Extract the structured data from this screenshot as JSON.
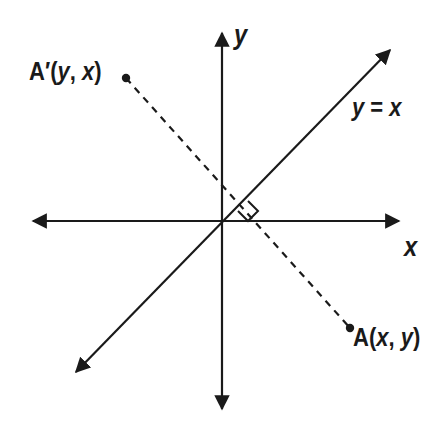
{
  "figure": {
    "background_color": "#ffffff",
    "stroke_color": "#1a1a1a",
    "width": 442,
    "height": 433
  },
  "axes": {
    "origin": {
      "x": 222,
      "y": 221
    },
    "x_axis": {
      "label": "x",
      "from": {
        "x": 30,
        "y": 221
      },
      "to": {
        "x": 402,
        "y": 221
      },
      "arrows": "both"
    },
    "y_axis": {
      "label": "y",
      "from": {
        "x": 222,
        "y": 412
      },
      "to": {
        "x": 222,
        "y": 30
      },
      "arrows": "both"
    }
  },
  "lines": [
    {
      "name": "line-y-equals-x",
      "label": "y = x",
      "label_parts": {
        "lhs": "y",
        "operator": " = ",
        "rhs": "x"
      },
      "style": "solid",
      "arrows": "both",
      "slope": 1,
      "from": {
        "x": 73,
        "y": 375
      },
      "to": {
        "x": 393,
        "y": 47
      }
    },
    {
      "name": "segment-a-to-a-prime",
      "style": "dashed",
      "arrows": "none",
      "slope": -1,
      "from": {
        "x": 126,
        "y": 78
      },
      "to": {
        "x": 350,
        "y": 328
      }
    }
  ],
  "points": [
    {
      "name": "point-a-prime",
      "label": "A'(y, x)",
      "label_parts": {
        "prefix": "A′(",
        "first": "y",
        "sep": ", ",
        "second": "x",
        "suffix": ")"
      },
      "marker": {
        "x": 126,
        "y": 78
      },
      "label_position": {
        "x": 29,
        "y": 59
      }
    },
    {
      "name": "point-a",
      "label": "A(x, y)",
      "label_parts": {
        "prefix": "A(",
        "first": "x",
        "sep": ", ",
        "second": "y",
        "suffix": ")"
      },
      "marker": {
        "x": 350,
        "y": 328
      },
      "label_position": {
        "x": 353,
        "y": 325
      }
    }
  ],
  "annotations": [
    {
      "name": "right-angle-marker",
      "type": "right-angle-square",
      "description": "perpendicular mark between line y = x and segment AA'",
      "corner_points": [
        {
          "x": 238,
          "y": 211
        },
        {
          "x": 248,
          "y": 221
        },
        {
          "x": 258,
          "y": 211
        },
        {
          "x": 248,
          "y": 201
        }
      ]
    }
  ]
}
